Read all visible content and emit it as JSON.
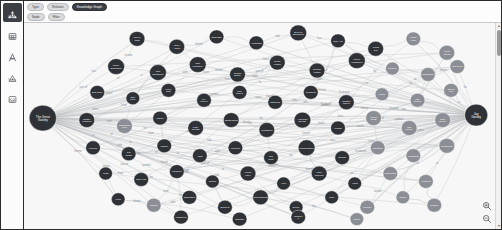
{
  "app": {
    "accent_dark": "#3c3f44",
    "node_dark": "#2e3136",
    "node_grey": "#8b8f95",
    "canvas_bg": "#f7f7f7",
    "edge_color": "#b9bcc0"
  },
  "sidebar": {
    "items": [
      {
        "label": "Graph",
        "icon": "graph-icon",
        "active": true
      },
      {
        "label": "Table",
        "icon": "table-icon",
        "active": false
      },
      {
        "label": "Text",
        "icon": "text-icon",
        "active": false
      },
      {
        "label": "Vision",
        "icon": "vision-icon",
        "active": false
      },
      {
        "label": "Code",
        "icon": "code-icon",
        "active": false
      }
    ]
  },
  "toolbar": {
    "row1": [
      {
        "label": "Type",
        "dark": false
      },
      {
        "label": "Relation",
        "dark": false
      },
      {
        "label": "Knowledge Graph",
        "dark": true
      }
    ],
    "row2": [
      {
        "label": "Node",
        "dark": false
      },
      {
        "label": "Filter",
        "dark": false
      }
    ]
  },
  "scrollbar": {
    "up": "▲",
    "down": "▼"
  },
  "zoom_controls": [
    {
      "name": "zoom-in-button",
      "glyph": "🔍"
    },
    {
      "name": "zoom-out-button",
      "glyph": "🔎"
    }
  ],
  "chart_data": {
    "type": "diagram",
    "title": "Knowledge Graph",
    "layout": "force-directed node-link",
    "hubs": [
      {
        "id": "h1",
        "label": "The Great Gatsby",
        "x": 18,
        "y": 96,
        "r": 13,
        "color": "#2e3136"
      },
      {
        "id": "h2",
        "label": "Jay Gatsby",
        "x": 432,
        "y": 93,
        "r": 11,
        "color": "#2e3136"
      }
    ],
    "nodes": [
      {
        "label": "Green Light",
        "x": 108,
        "y": 16,
        "r": 7.5,
        "color": "#2e3136"
      },
      {
        "label": "Valley Ashes",
        "x": 146,
        "y": 24,
        "r": 7.5,
        "color": "#2e3136"
      },
      {
        "label": "East Egg",
        "x": 184,
        "y": 14,
        "r": 7,
        "color": "#2e3136"
      },
      {
        "label": "West Egg",
        "x": 222,
        "y": 20,
        "r": 7,
        "color": "#2e3136"
      },
      {
        "label": "Eyes of Eckleburg",
        "x": 262,
        "y": 10,
        "r": 8,
        "color": "#2e3136"
      },
      {
        "label": "Jazz Age",
        "x": 300,
        "y": 18,
        "r": 7,
        "color": "#2e3136"
      },
      {
        "label": "Yellow Car",
        "x": 336,
        "y": 26,
        "r": 7.5,
        "color": "#2e3136"
      },
      {
        "label": "Plaza Hotel",
        "x": 372,
        "y": 16,
        "r": 7,
        "color": "#8b8f95"
      },
      {
        "label": "Long Island",
        "x": 404,
        "y": 30,
        "r": 7.5,
        "color": "#8b8f95"
      },
      {
        "label": "Daisy Buchanan",
        "x": 88,
        "y": 44,
        "r": 8,
        "color": "#2e3136"
      },
      {
        "label": "Tom Buchanan",
        "x": 128,
        "y": 50,
        "r": 8,
        "color": "#2e3136"
      },
      {
        "label": "Nick Carraway",
        "x": 166,
        "y": 42,
        "r": 8,
        "color": "#2e3136"
      },
      {
        "label": "Jordan Baker",
        "x": 204,
        "y": 52,
        "r": 7.5,
        "color": "#2e3136"
      },
      {
        "label": "Myrtle Wilson",
        "x": 242,
        "y": 40,
        "r": 7.5,
        "color": "#2e3136"
      },
      {
        "label": "George Wilson",
        "x": 280,
        "y": 48,
        "r": 7.5,
        "color": "#2e3136"
      },
      {
        "label": "Meyer Wolfsheim",
        "x": 318,
        "y": 38,
        "r": 8,
        "color": "#2e3136"
      },
      {
        "label": "Pammy",
        "x": 352,
        "y": 46,
        "r": 6.5,
        "color": "#8b8f95"
      },
      {
        "label": "Klipspringer",
        "x": 386,
        "y": 52,
        "r": 7,
        "color": "#8b8f95"
      },
      {
        "label": "Owl Eyes",
        "x": 414,
        "y": 44,
        "r": 7,
        "color": "#8b8f95"
      },
      {
        "label": "Dan Cody",
        "x": 70,
        "y": 70,
        "r": 7,
        "color": "#2e3136"
      },
      {
        "label": "Ella Kaye",
        "x": 104,
        "y": 76,
        "r": 6.5,
        "color": "#2e3136"
      },
      {
        "label": "Henry Gatz",
        "x": 138,
        "y": 68,
        "r": 7,
        "color": "#2e3136"
      },
      {
        "label": "Mr. McKee",
        "x": 172,
        "y": 78,
        "r": 7,
        "color": "#2e3136"
      },
      {
        "label": "Mrs. McKee",
        "x": 206,
        "y": 70,
        "r": 7,
        "color": "#2e3136"
      },
      {
        "label": "Catherine",
        "x": 240,
        "y": 80,
        "r": 7,
        "color": "#2e3136"
      },
      {
        "label": "Michaelis",
        "x": 274,
        "y": 70,
        "r": 7,
        "color": "#2e3136"
      },
      {
        "label": "Chester McKee",
        "x": 308,
        "y": 80,
        "r": 7.5,
        "color": "#2e3136"
      },
      {
        "label": "Lucille",
        "x": 342,
        "y": 72,
        "r": 6.5,
        "color": "#8b8f95"
      },
      {
        "label": "Mrs. Sloane",
        "x": 376,
        "y": 78,
        "r": 7,
        "color": "#8b8f95"
      },
      {
        "label": "Ewing Klip",
        "x": 408,
        "y": 68,
        "r": 7,
        "color": "#8b8f95"
      },
      {
        "label": "Gatsby Mansion",
        "x": 60,
        "y": 98,
        "r": 7.5,
        "color": "#2e3136"
      },
      {
        "label": "Swimming Pool",
        "x": 96,
        "y": 104,
        "r": 7.5,
        "color": "#8b8f95"
      },
      {
        "label": "Library",
        "x": 130,
        "y": 96,
        "r": 7,
        "color": "#2e3136"
      },
      {
        "label": "Party Guests",
        "x": 164,
        "y": 106,
        "r": 7.5,
        "color": "#2e3136"
      },
      {
        "label": "Bootlegging",
        "x": 198,
        "y": 98,
        "r": 7.5,
        "color": "#2e3136"
      },
      {
        "label": "Prohibition",
        "x": 232,
        "y": 108,
        "r": 7.5,
        "color": "#2e3136"
      },
      {
        "label": "American Dream",
        "x": 266,
        "y": 98,
        "r": 8,
        "color": "#2e3136"
      },
      {
        "label": "Wealth",
        "x": 300,
        "y": 106,
        "r": 7,
        "color": "#2e3136"
      },
      {
        "label": "Social Class",
        "x": 334,
        "y": 96,
        "r": 7.5,
        "color": "#8b8f95"
      },
      {
        "label": "Old Money",
        "x": 368,
        "y": 106,
        "r": 7.5,
        "color": "#8b8f95"
      },
      {
        "label": "New Money",
        "x": 400,
        "y": 98,
        "r": 7.5,
        "color": "#8b8f95"
      },
      {
        "label": "Funeral",
        "x": 66,
        "y": 126,
        "r": 7,
        "color": "#2e3136"
      },
      {
        "label": "Car Crash",
        "x": 100,
        "y": 132,
        "r": 7,
        "color": "#2e3136"
      },
      {
        "label": "Murder",
        "x": 134,
        "y": 124,
        "r": 7,
        "color": "#2e3136"
      },
      {
        "label": "Affair",
        "x": 168,
        "y": 134,
        "r": 7,
        "color": "#2e3136"
      },
      {
        "label": "Reunion",
        "x": 202,
        "y": 126,
        "r": 7,
        "color": "#2e3136"
      },
      {
        "label": "Tea Party",
        "x": 236,
        "y": 136,
        "r": 7,
        "color": "#2e3136"
      },
      {
        "label": "Confrontation",
        "x": 270,
        "y": 126,
        "r": 8,
        "color": "#2e3136"
      },
      {
        "label": "Suicide",
        "x": 304,
        "y": 136,
        "r": 7,
        "color": "#2e3136"
      },
      {
        "label": "Narration",
        "x": 338,
        "y": 126,
        "r": 7,
        "color": "#8b8f95"
      },
      {
        "label": "Flashback",
        "x": 372,
        "y": 134,
        "r": 7,
        "color": "#8b8f95"
      },
      {
        "label": "Symbolism",
        "x": 404,
        "y": 124,
        "r": 7.5,
        "color": "#8b8f95"
      },
      {
        "label": "1922",
        "x": 78,
        "y": 152,
        "r": 6.5,
        "color": "#2e3136"
      },
      {
        "label": "New York",
        "x": 112,
        "y": 158,
        "r": 7,
        "color": "#2e3136"
      },
      {
        "label": "Louisville",
        "x": 146,
        "y": 150,
        "r": 7,
        "color": "#2e3136"
      },
      {
        "label": "Oxford",
        "x": 180,
        "y": 160,
        "r": 6.5,
        "color": "#2e3136"
      },
      {
        "label": "World War I",
        "x": 214,
        "y": 152,
        "r": 7.5,
        "color": "#2e3136"
      },
      {
        "label": "Army",
        "x": 248,
        "y": 162,
        "r": 6.5,
        "color": "#2e3136"
      },
      {
        "label": "Lake Superior",
        "x": 282,
        "y": 152,
        "r": 7.5,
        "color": "#2e3136"
      },
      {
        "label": "Yacht",
        "x": 316,
        "y": 162,
        "r": 6.5,
        "color": "#2e3136"
      },
      {
        "label": "Minnesota",
        "x": 350,
        "y": 152,
        "r": 7,
        "color": "#8b8f95"
      },
      {
        "label": "Midwest",
        "x": 384,
        "y": 160,
        "r": 7,
        "color": "#8b8f95"
      },
      {
        "label": "Hope",
        "x": 90,
        "y": 178,
        "r": 6.5,
        "color": "#2e3136"
      },
      {
        "label": "Illusion",
        "x": 124,
        "y": 184,
        "r": 7,
        "color": "#8b8f95"
      },
      {
        "label": "Obsession",
        "x": 158,
        "y": 176,
        "r": 7,
        "color": "#2e3136"
      },
      {
        "label": "Betrayal",
        "x": 192,
        "y": 186,
        "r": 7,
        "color": "#2e3136"
      },
      {
        "label": "Carelessness",
        "x": 226,
        "y": 176,
        "r": 7.5,
        "color": "#2e3136"
      },
      {
        "label": "Decay",
        "x": 260,
        "y": 186,
        "r": 6.5,
        "color": "#2e3136"
      },
      {
        "label": "Time",
        "x": 294,
        "y": 176,
        "r": 6.5,
        "color": "#2e3136"
      },
      {
        "label": "Memory",
        "x": 328,
        "y": 186,
        "r": 7,
        "color": "#8b8f95"
      },
      {
        "label": "Desire",
        "x": 362,
        "y": 176,
        "r": 6.5,
        "color": "#8b8f95"
      },
      {
        "label": "Tragedy",
        "x": 392,
        "y": 184,
        "r": 7,
        "color": "#8b8f95"
      },
      {
        "label": "Fitzgerald",
        "x": 150,
        "y": 196,
        "r": 7,
        "color": "#2e3136"
      },
      {
        "label": "Narrator",
        "x": 206,
        "y": 198,
        "r": 7,
        "color": "#2e3136"
      },
      {
        "label": "Chapter 1",
        "x": 262,
        "y": 196,
        "r": 7,
        "color": "#2e3136"
      },
      {
        "label": "Novel",
        "x": 318,
        "y": 198,
        "r": 6.5,
        "color": "#8b8f95"
      }
    ],
    "edge_labels": [
      "has",
      "in",
      "of",
      "at",
      "is",
      "to",
      "by",
      "from",
      "with",
      "for",
      "loves",
      "owns",
      "lives",
      "kills",
      "meets",
      "knows",
      "part of",
      "located",
      "symbol",
      "theme",
      "friend",
      "wife",
      "husband"
    ]
  }
}
